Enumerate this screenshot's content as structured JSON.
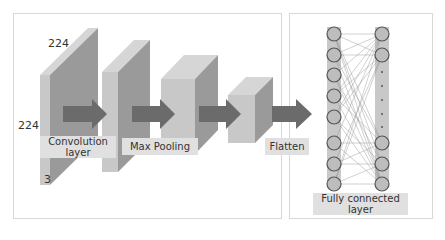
{
  "dims": {
    "width": "224",
    "height": "224",
    "depth": "3"
  },
  "labels": {
    "conv": "Convolution layer",
    "conv_line1": "Convolution",
    "conv_line2": "layer",
    "pool": "Max Pooling",
    "flatten": "Flatten",
    "fc_line1": "Fully connected",
    "fc_line2": "layer"
  },
  "colors": {
    "front": "#c8c8c8",
    "side": "#9a9a9a",
    "top": "#d6d6d6",
    "arrow": "#6b6b6b",
    "node": "#bdbdbd"
  }
}
